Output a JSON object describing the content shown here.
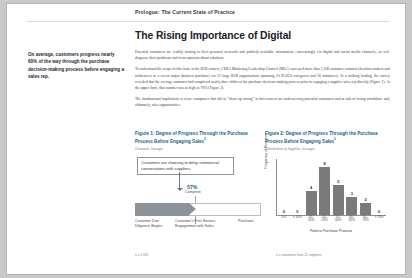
{
  "header": {
    "title": "Prologue: The Current State of Practice"
  },
  "page_title": "The Rising Importance of Digital",
  "pull_quote": "On average, customers progress nearly 60% of the way through the purchase decision-making process before engaging a sales rep.",
  "body": {
    "p1": "Potential customers are readily turning to their personal networks and publicly available information—increasingly via digital and social media channels—to self-diagnose their problems and form opinions about solutions.",
    "p2": "To understand the scope of this issue in the B2B context, CEB's Marketing Leadership Council (MLC) surveyed more than 1,500 customer contacts (decision makers and influencers in a recent major business purchase) for 22 large B2B organizations spanning 10 NAICS categories and 16 industries). In a striking finding, the survey revealed that the average customer had completed nearly three-fifths of the purchase decision-making process prior to engaging a supplier sales rep directly (Figure 1). At the upper limit, that number was as high as 70% (Figure 2).",
    "p3": "The fundamental implication is clear: companies that fail to “show up strong” in this context are underserving potential customers and at risk of losing mindshare and, ultimately, sales opportunities."
  },
  "figure1": {
    "number": "Figure 1:",
    "title": "Figure 1: Degree of Progress Through the Purchase Process Before Engaging Sales",
    "subtitle": "Customer Average",
    "superscript": "2",
    "callout": "Customers are choosing to delay commercial conversations with suppliers.",
    "percent": "57%",
    "percent_sub": "Complete",
    "axis_labels": [
      "Customer Due Diligence Begins",
      "Customer's First Serious Engagement with Sales",
      "Purchase"
    ],
    "footnote": "n = 1,926"
  },
  "figure2": {
    "title": "Figure 2: Degree of Progress Through the Purchase Process Before Engaging Sales",
    "subtitle": "Distribution of Supplier Averages",
    "superscript": "3",
    "footnote": "n = customers from 22 suppliers"
  },
  "chart_data": {
    "type": "bar",
    "title": "Figure 2: Degree of Progress Through the Purchase Process Before Engaging Sales",
    "subtitle": "Distribution of Supplier Averages",
    "categories": [
      "0%",
      "< 45%",
      "45–50%",
      "50–55%",
      "55–60%",
      "60–65%",
      "65–70%",
      "> 70%"
    ],
    "values": [
      0,
      0,
      4,
      8,
      5,
      3,
      2,
      0
    ],
    "xlabel": "Point in Purchase Process",
    "ylabel": "Frequency of Response",
    "ylim": [
      0,
      9
    ],
    "grid": false,
    "bar_color": "#7a7a7a"
  },
  "colors": {
    "accent": "#1a5e86",
    "bar": "#7a7a7a",
    "arrow": "#8c9297",
    "page": "#ffffff",
    "canvas": "#c9c9c9"
  }
}
